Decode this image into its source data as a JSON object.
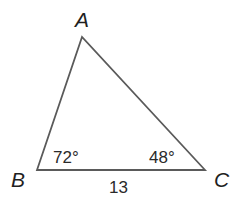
{
  "diagram": {
    "type": "triangle",
    "vertices": [
      {
        "name": "A",
        "label": "A"
      },
      {
        "name": "B",
        "label": "B"
      },
      {
        "name": "C",
        "label": "C"
      }
    ],
    "angles": [
      {
        "vertex": "B",
        "label": "72°"
      },
      {
        "vertex": "C",
        "label": "48°"
      }
    ],
    "sides": [
      {
        "between": "BC",
        "label": "13"
      }
    ],
    "colors": {
      "line": "#555555",
      "text": "#222222",
      "background": "#ffffff"
    }
  }
}
